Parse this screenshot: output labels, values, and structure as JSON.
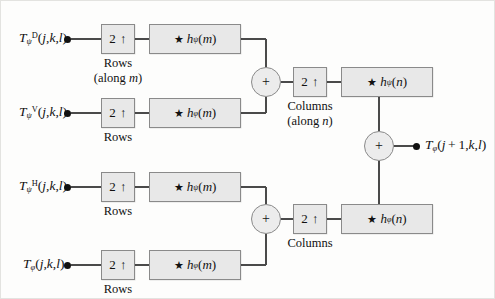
{
  "diagram": {
    "inputs": [
      {
        "id": "in-diagonal",
        "label": "T",
        "sub": "ψ",
        "sup": "D",
        "args": "(j,k,l)"
      },
      {
        "id": "in-vertical",
        "label": "T",
        "sub": "ψ",
        "sup": "V",
        "args": "(j,k,l)"
      },
      {
        "id": "in-horizontal",
        "label": "T",
        "sub": "ψ",
        "sup": "H",
        "args": "(j,k,l)"
      },
      {
        "id": "in-approx",
        "label": "T",
        "sub": "φ",
        "sup": "",
        "args": "(j,k,l)"
      }
    ],
    "output": {
      "id": "out-approx",
      "label": "T",
      "sub": "φ",
      "sup": "",
      "args": "(j+1,k,l)"
    },
    "upsamplers": [
      {
        "id": "up-rows-1",
        "value": "2 ↑",
        "caption1": "Rows",
        "caption2": "(along m)"
      },
      {
        "id": "up-rows-2",
        "value": "2 ↑",
        "caption1": "Rows",
        "caption2": ""
      },
      {
        "id": "up-rows-3",
        "value": "2 ↑",
        "caption1": "Rows",
        "caption2": ""
      },
      {
        "id": "up-rows-4",
        "value": "2 ↑",
        "caption1": "Rows",
        "caption2": ""
      },
      {
        "id": "up-cols-1",
        "value": "2 ↑",
        "caption1": "Columns",
        "caption2": "(along n)"
      },
      {
        "id": "up-cols-2",
        "value": "2 ↑",
        "caption1": "Columns",
        "caption2": ""
      }
    ],
    "filters": [
      {
        "id": "filt-row-psi-1",
        "star": "★",
        "h": "h",
        "sub": "ψ",
        "arg": "(m)"
      },
      {
        "id": "filt-row-phi-1",
        "star": "★",
        "h": "h",
        "sub": "φ",
        "arg": "(m)"
      },
      {
        "id": "filt-row-psi-2",
        "star": "★",
        "h": "h",
        "sub": "ψ",
        "arg": "(m)"
      },
      {
        "id": "filt-row-phi-2",
        "star": "★",
        "h": "h",
        "sub": "φ",
        "arg": "(m)"
      },
      {
        "id": "filt-col-psi",
        "star": "★",
        "h": "h",
        "sub": "ψ",
        "arg": "(n)"
      },
      {
        "id": "filt-col-phi",
        "star": "★",
        "h": "h",
        "sub": "φ",
        "arg": "(n)"
      }
    ],
    "adders": [
      {
        "id": "adder-top",
        "symbol": "+"
      },
      {
        "id": "adder-bottom",
        "symbol": "+"
      },
      {
        "id": "adder-final",
        "symbol": "+"
      }
    ],
    "colors": {
      "box_fill": "#e8e8e8",
      "box_border": "#8a8a8a",
      "wire": "#4a4a4a",
      "text": "#111111",
      "background": "#fdfdfc"
    }
  }
}
